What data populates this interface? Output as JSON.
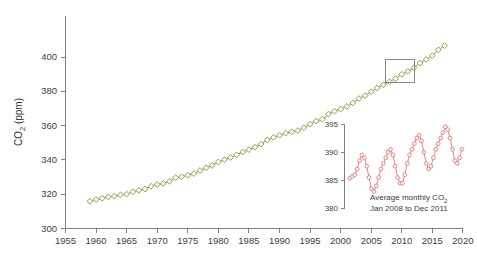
{
  "chart_data": [
    {
      "id": "main",
      "type": "line",
      "title": "",
      "xlabel": "",
      "ylabel": "CO2 (ppm)",
      "ylabel_base": "CO",
      "ylabel_sub": "2",
      "ylabel_unit": " (ppm)",
      "xlim": [
        1955,
        2020
      ],
      "ylim": [
        300,
        410
      ],
      "xticks": [
        1955,
        1960,
        1965,
        1970,
        1975,
        1980,
        1985,
        1990,
        1995,
        2000,
        2005,
        2010,
        2015,
        2020
      ],
      "yticks": [
        300,
        320,
        340,
        360,
        380,
        400
      ],
      "grid": false,
      "legend": "none",
      "marker": "open-diamond",
      "series_color": "#9a9a56",
      "series": [
        {
          "name": "Annual mean CO2",
          "x": [
            1959,
            1960,
            1961,
            1962,
            1963,
            1964,
            1965,
            1966,
            1967,
            1968,
            1969,
            1970,
            1971,
            1972,
            1973,
            1974,
            1975,
            1976,
            1977,
            1978,
            1979,
            1980,
            1981,
            1982,
            1983,
            1984,
            1985,
            1986,
            1987,
            1988,
            1989,
            1990,
            1991,
            1992,
            1993,
            1994,
            1995,
            1996,
            1997,
            1998,
            1999,
            2000,
            2001,
            2002,
            2003,
            2004,
            2005,
            2006,
            2007,
            2008,
            2009,
            2010,
            2011,
            2012,
            2013,
            2014,
            2015,
            2016,
            2017
          ],
          "values": [
            315.9,
            316.9,
            317.6,
            318.4,
            318.9,
            319.6,
            320.0,
            321.4,
            322.2,
            323.0,
            324.6,
            325.7,
            326.3,
            327.5,
            329.7,
            330.2,
            331.1,
            332.0,
            333.8,
            335.4,
            336.8,
            338.8,
            340.1,
            341.4,
            343.0,
            344.6,
            346.0,
            347.4,
            349.2,
            351.6,
            353.1,
            354.4,
            355.6,
            356.4,
            357.1,
            358.8,
            360.8,
            362.6,
            363.7,
            366.7,
            368.4,
            369.6,
            371.1,
            373.2,
            375.8,
            377.5,
            379.8,
            381.9,
            383.8,
            385.6,
            387.4,
            389.9,
            391.6,
            393.8,
            396.5,
            398.6,
            400.8,
            404.2,
            406.6
          ]
        }
      ],
      "annotations": [
        {
          "name": "highlight-rectangle",
          "type": "rect",
          "x_range": [
            2007.4,
            2012.1
          ],
          "y_range": [
            385.0,
            398.5
          ],
          "stroke": "#888888"
        }
      ]
    },
    {
      "id": "inset",
      "type": "line",
      "title": "",
      "caption_line1_base": "Average monthly CO",
      "caption_line1_sub": "2",
      "caption_line2": "Jan 2008 to Dec 2011",
      "xlabel": "",
      "ylabel": "",
      "ylim": [
        380,
        396
      ],
      "yticks": [
        380,
        385,
        390,
        395
      ],
      "grid": false,
      "legend": "none",
      "marker": "open-circle",
      "series_color": "#d68a84",
      "x_start_label": "Jan 2008",
      "x_end_label": "Dec 2011",
      "series": [
        {
          "name": "Monthly mean CO2",
          "x_months": [
            "2008-01",
            "2008-02",
            "2008-03",
            "2008-04",
            "2008-05",
            "2008-06",
            "2008-07",
            "2008-08",
            "2008-09",
            "2008-10",
            "2008-11",
            "2008-12",
            "2009-01",
            "2009-02",
            "2009-03",
            "2009-04",
            "2009-05",
            "2009-06",
            "2009-07",
            "2009-08",
            "2009-09",
            "2009-10",
            "2009-11",
            "2009-12",
            "2010-01",
            "2010-02",
            "2010-03",
            "2010-04",
            "2010-05",
            "2010-06",
            "2010-07",
            "2010-08",
            "2010-09",
            "2010-10",
            "2010-11",
            "2010-12",
            "2011-01",
            "2011-02",
            "2011-03",
            "2011-04",
            "2011-05",
            "2011-06",
            "2011-07",
            "2011-08",
            "2011-09",
            "2011-10",
            "2011-11",
            "2011-12"
          ],
          "values": [
            385.4,
            385.7,
            386.0,
            387.0,
            388.5,
            389.5,
            389.0,
            387.5,
            385.5,
            383.5,
            383.0,
            384.0,
            385.5,
            387.0,
            388.0,
            389.0,
            390.0,
            390.5,
            389.5,
            387.5,
            385.5,
            384.5,
            384.5,
            386.0,
            388.0,
            389.5,
            390.5,
            391.5,
            392.5,
            393.0,
            392.0,
            390.0,
            388.0,
            387.0,
            387.5,
            389.0,
            390.5,
            391.5,
            392.5,
            393.5,
            394.5,
            394.0,
            392.5,
            390.5,
            388.5,
            388.0,
            389.0,
            390.5
          ]
        }
      ]
    }
  ]
}
